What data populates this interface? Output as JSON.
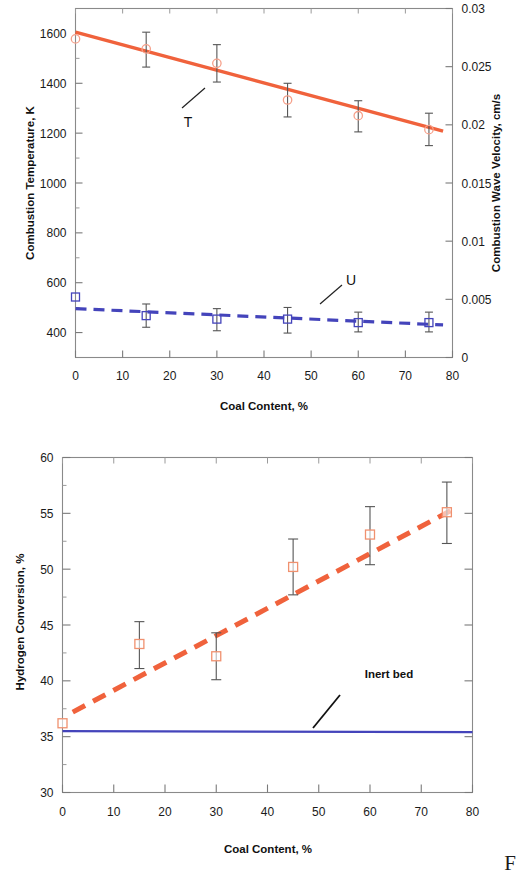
{
  "page": {
    "corner_glyph": "F"
  },
  "charts": [
    {
      "id": "combustion-temperature-velocity",
      "xlabel": "Coal Content, %",
      "ylabel_left": "Combustion Temperature, K",
      "ylabel_right": "Combustion Wave Velocity, cm/s",
      "xticks": [
        "0",
        "10",
        "20",
        "30",
        "40",
        "50",
        "60",
        "70",
        "80"
      ],
      "yticks_left": [
        "400",
        "600",
        "800",
        "1000",
        "1200",
        "1400",
        "1600"
      ],
      "yticks_right": [
        "0",
        "0.005",
        "0.01",
        "0.015",
        "0.02",
        "0.025",
        "0.03"
      ],
      "series_labels": {
        "temperature": "T",
        "velocity": "U"
      }
    },
    {
      "id": "hydrogen-conversion",
      "xlabel": "Coal Content, %",
      "ylabel_left": "Hydrogen Conversion, %",
      "xticks": [
        "0",
        "10",
        "20",
        "30",
        "40",
        "50",
        "60",
        "70",
        "80"
      ],
      "yticks_left": [
        "30",
        "35",
        "40",
        "45",
        "50",
        "55",
        "60"
      ],
      "annotation": "Inert bed"
    }
  ],
  "chart_data": [
    {
      "type": "scatter",
      "id": "combustion-temperature-velocity",
      "title": "",
      "xlabel": "Coal Content, %",
      "ylabel": "Combustion Temperature, K",
      "ylabel_right": "Combustion Wave Velocity, cm/s",
      "xlim": [
        0,
        80
      ],
      "ylim": [
        300,
        1700
      ],
      "ylim_right": [
        0,
        0.03
      ],
      "xticks": [
        0,
        10,
        20,
        30,
        40,
        50,
        60,
        70,
        80
      ],
      "yticks": [
        400,
        600,
        800,
        1000,
        1200,
        1400,
        1600
      ],
      "yticks_right": [
        0,
        0.005,
        0.01,
        0.015,
        0.02,
        0.025,
        0.03
      ],
      "grid": false,
      "legend": "inline-annotations",
      "colors": {
        "temperature": "#f0623c",
        "velocity": "#4444bb",
        "error_bar": "#555555"
      },
      "series": [
        {
          "name": "T",
          "label": "Combustion Temperature",
          "axis": "left",
          "marker": "open-circle",
          "line_style": "solid",
          "color": "#f0623c",
          "x": [
            0,
            15,
            30,
            45,
            60,
            75
          ],
          "values": [
            1578,
            1538,
            1480,
            1333,
            1270,
            1214
          ],
          "err_low": [
            1578,
            1465,
            1405,
            1265,
            1205,
            1150
          ],
          "err_high": [
            1578,
            1605,
            1555,
            1400,
            1330,
            1280
          ],
          "fit_line": {
            "x": [
              0,
              78
            ],
            "y": [
              1605,
              1208
            ]
          }
        },
        {
          "name": "U",
          "label": "Combustion Wave Velocity",
          "axis": "right",
          "marker": "open-square",
          "line_style": "dashed",
          "color": "#4444bb",
          "x": [
            0,
            15,
            30,
            45,
            60,
            75
          ],
          "values": [
            0.0052,
            0.0036,
            0.0033,
            0.0033,
            0.003,
            0.003
          ],
          "err_low": [
            0.0052,
            0.0026,
            0.0023,
            0.0021,
            0.0022,
            0.0022
          ],
          "err_high": [
            0.0052,
            0.0046,
            0.0042,
            0.0043,
            0.0039,
            0.0039
          ],
          "fit_line": {
            "x": [
              0,
              78
            ],
            "y": [
              0.0042,
              0.0028
            ]
          }
        }
      ]
    },
    {
      "type": "scatter",
      "id": "hydrogen-conversion",
      "title": "",
      "xlabel": "Coal Content, %",
      "ylabel": "Hydrogen Conversion, %",
      "xlim": [
        0,
        80
      ],
      "ylim": [
        30,
        60
      ],
      "xticks": [
        0,
        10,
        20,
        30,
        40,
        50,
        60,
        70,
        80
      ],
      "yticks": [
        30,
        35,
        40,
        45,
        50,
        55,
        60
      ],
      "grid": false,
      "legend": "inline-annotations",
      "colors": {
        "conversion": "#f0623c",
        "inert_bed": "#4444bb",
        "error_bar": "#555555"
      },
      "series": [
        {
          "name": "Hydrogen Conversion",
          "marker": "open-square",
          "line_style": "dashed",
          "color": "#f0623c",
          "x": [
            0,
            15,
            30,
            45,
            60,
            75
          ],
          "values": [
            36.2,
            43.3,
            42.2,
            50.2,
            53.1,
            55.1
          ],
          "err_low": [
            36.2,
            41.1,
            40.1,
            47.7,
            50.4,
            52.3
          ],
          "err_high": [
            36.2,
            45.3,
            44.3,
            52.7,
            55.6,
            57.8
          ],
          "fit_line": {
            "x": [
              2,
              76
            ],
            "y": [
              37.2,
              55.3
            ]
          }
        },
        {
          "name": "Inert bed",
          "marker": "none",
          "line_style": "solid",
          "color": "#4444bb",
          "x": [
            0,
            80
          ],
          "values": [
            35.5,
            35.4
          ],
          "annotation": "Inert bed"
        }
      ]
    }
  ]
}
